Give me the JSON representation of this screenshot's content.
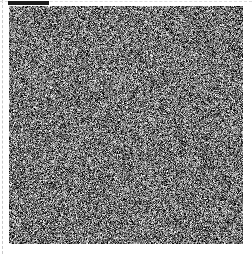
{
  "figure": {
    "title": "",
    "background_color": "#ffffff",
    "width": 252,
    "height": 254
  },
  "guides": {
    "left_guide": {
      "style": "dashed",
      "color": "#c9c9c9",
      "orientation": "vertical",
      "x": 2
    },
    "top_guide": {
      "style": "dashed",
      "color": "#dcdcdc",
      "orientation": "horizontal",
      "y": 1
    }
  },
  "marker_bar": {
    "label": "",
    "color": "#1c1c1c",
    "x": 8,
    "y": 1,
    "width": 41,
    "height": 4
  },
  "noise_panel": {
    "label": "",
    "x": 9,
    "y": 6,
    "width": 234,
    "height": 238,
    "type": "uniform-random-grayscale-noise",
    "grain_size_px": 1,
    "mean_gray": "#737373",
    "min_gray": "#000000",
    "max_gray": "#ffffff",
    "seed": 20240517
  }
}
